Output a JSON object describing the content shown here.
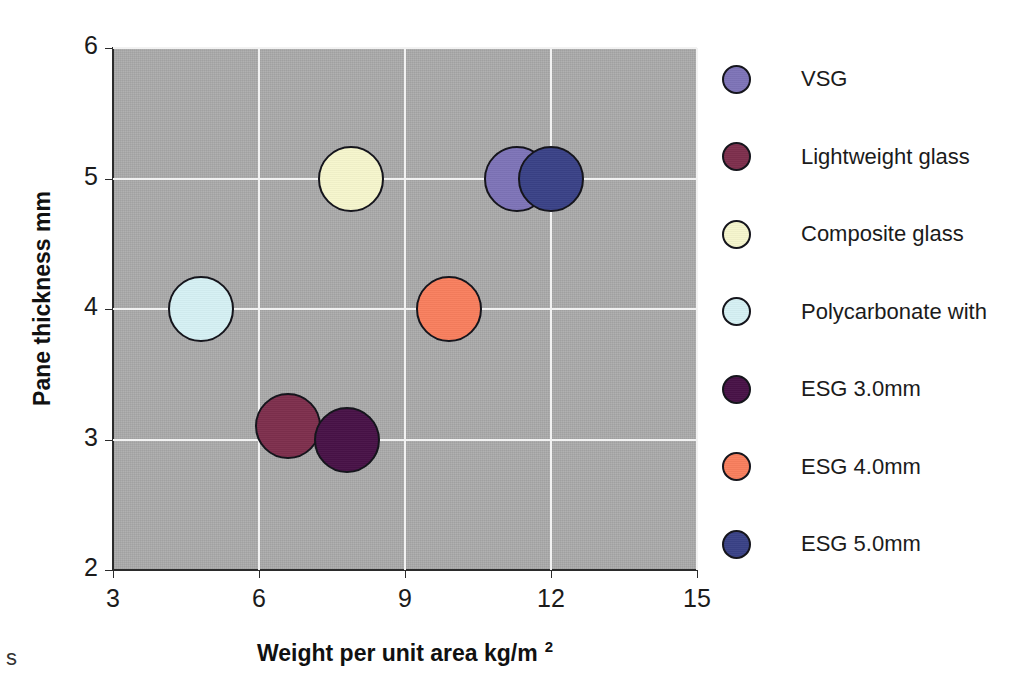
{
  "chart_data": {
    "type": "scatter",
    "title": "",
    "xlabel": "Weight per unit area kg/m",
    "xlabel_superscript": "2",
    "ylabel": "Pane thickness  mm",
    "xlim": [
      3,
      15
    ],
    "ylim": [
      2,
      6
    ],
    "xticks": [
      3,
      6,
      9,
      12,
      15
    ],
    "yticks": [
      2,
      3,
      4,
      5,
      6
    ],
    "grid": true,
    "grid_color": "#f2f2f2",
    "plot_background": "#ababab",
    "legend_position": "right",
    "marker_shape": "circle",
    "marker_edge_color": "#15151c",
    "series": [
      {
        "name": "VSG",
        "color": "#7e74b8",
        "x": 11.3,
        "y": 5.0,
        "size_px": 66
      },
      {
        "name": "Lightweight glass",
        "color": "#7e2f4d",
        "x": 6.6,
        "y": 3.1,
        "size_px": 66
      },
      {
        "name": "Composite glass",
        "color": "#f6f6cd",
        "x": 7.9,
        "y": 5.0,
        "size_px": 66
      },
      {
        "name": "Polycarbonate with",
        "color": "#d6f1f4",
        "x": 4.8,
        "y": 4.0,
        "size_px": 66
      },
      {
        "name": "ESG 3.0mm",
        "color": "#481247",
        "x": 7.8,
        "y": 3.0,
        "size_px": 66
      },
      {
        "name": "ESG 4.0mm",
        "color": "#f97f5e",
        "x": 9.9,
        "y": 4.0,
        "size_px": 66
      },
      {
        "name": "ESG 5.0mm",
        "color": "#3a4287",
        "x": 12.0,
        "y": 5.0,
        "size_px": 66
      }
    ]
  },
  "axes": {
    "x_tick_labels": [
      "3",
      "6",
      "9",
      "12",
      "15"
    ],
    "y_tick_labels": [
      "2",
      "3",
      "4",
      "5",
      "6"
    ],
    "x_title_main": "Weight per unit area kg/m",
    "x_title_sup": "2",
    "y_title": "Pane thickness  mm"
  },
  "legend": {
    "entries": [
      {
        "label": "VSG",
        "color": "#7e74b8"
      },
      {
        "label": "Lightweight glass",
        "color": "#7e2f4d"
      },
      {
        "label": "Composite glass",
        "color": "#f6f6cd"
      },
      {
        "label": "Polycarbonate with",
        "color": "#d6f1f4"
      },
      {
        "label": "ESG 3.0mm",
        "color": "#481247"
      },
      {
        "label": "ESG 4.0mm",
        "color": "#f97f5e"
      },
      {
        "label": "ESG 5.0mm",
        "color": "#3a4287"
      }
    ]
  },
  "artifacts": {
    "bottom_left_fragment": "s"
  }
}
